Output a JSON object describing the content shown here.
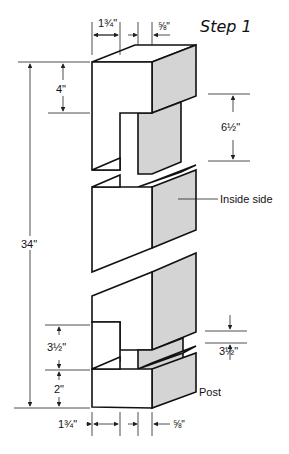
{
  "title": "Step 1",
  "colors": {
    "side_face": "#d4d4d4",
    "line": "#111111",
    "background": "#ffffff"
  },
  "labels": {
    "inside_side": "Inside side",
    "post": "Post"
  },
  "dimensions": {
    "top_width": "1¾\"",
    "top_offset": "⅝\"",
    "bottom_width": "1¾\"",
    "bottom_offset": "⅝\"",
    "total_height": "34\"",
    "top_block_height": "4\"",
    "upper_notch": "6½\"",
    "lower_notch_left": "3½\"",
    "bottom_block_height": "2\"",
    "lower_notch_right": "3½\""
  }
}
